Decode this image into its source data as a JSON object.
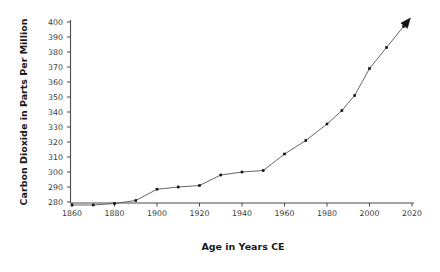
{
  "chart_data": {
    "type": "line",
    "title": "",
    "xlabel": "Age in Years CE",
    "ylabel": "Carbon Dioxide in Parts Per Million",
    "xlim": [
      1855,
      2025
    ],
    "ylim": [
      276,
      402
    ],
    "xticks": [
      1860,
      1880,
      1900,
      1920,
      1940,
      1960,
      1980,
      2000,
      2020
    ],
    "yticks": [
      280,
      290,
      300,
      310,
      320,
      330,
      340,
      350,
      360,
      370,
      380,
      390,
      400
    ],
    "grid": false,
    "legend": null,
    "series_name": "Atmospheric CO2",
    "line_color": "#555555",
    "marker_color": "#111111",
    "terminator": "arrowhead",
    "x": [
      1860,
      1870,
      1880,
      1890,
      1900,
      1910,
      1920,
      1930,
      1940,
      1950,
      1960,
      1970,
      1980,
      1987,
      1993,
      2000,
      2008,
      2016
    ],
    "y": [
      278,
      278,
      279,
      281,
      288.5,
      290,
      291,
      298,
      300,
      301,
      312,
      321,
      332,
      341,
      351,
      369,
      383,
      397
    ]
  },
  "axes": {
    "x_axis_label": "Age in Years CE",
    "y_axis_label": "Carbon Dioxide in Parts Per Million",
    "x_tick_labels": [
      "1860",
      "1880",
      "1900",
      "1920",
      "1940",
      "1960",
      "1980",
      "2000",
      "2020"
    ],
    "y_tick_labels": [
      "280",
      "290",
      "300",
      "310",
      "320",
      "330",
      "340",
      "350",
      "360",
      "370",
      "380",
      "390",
      "400"
    ]
  }
}
